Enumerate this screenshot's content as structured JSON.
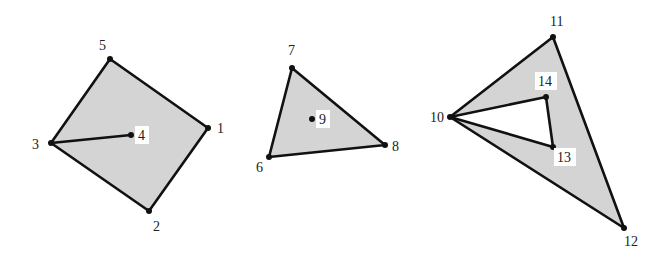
{
  "colors": {
    "fill": "#d4d4d4",
    "hole": "#ffffff",
    "edge": "#111111",
    "label": "#222222",
    "background": "#ffffff"
  },
  "vertices": [
    {
      "id": 1,
      "label": "1",
      "x": 208,
      "y": 128,
      "lx": 217,
      "ly": 133,
      "boxed": false
    },
    {
      "id": 2,
      "label": "2",
      "x": 149,
      "y": 211,
      "lx": 153,
      "ly": 231,
      "boxed": false
    },
    {
      "id": 3,
      "label": "3",
      "x": 51,
      "y": 143,
      "lx": 32,
      "ly": 149,
      "boxed": false
    },
    {
      "id": 4,
      "label": "4",
      "x": 131,
      "y": 135,
      "lx": 138,
      "ly": 140,
      "boxed": true
    },
    {
      "id": 5,
      "label": "5",
      "x": 110,
      "y": 59,
      "lx": 99,
      "ly": 50,
      "boxed": false
    },
    {
      "id": 6,
      "label": "6",
      "x": 269,
      "y": 157,
      "lx": 256,
      "ly": 172,
      "boxed": false
    },
    {
      "id": 7,
      "label": "7",
      "x": 292,
      "y": 68,
      "lx": 288,
      "ly": 55,
      "boxed": false
    },
    {
      "id": 8,
      "label": "8",
      "x": 385,
      "y": 145,
      "lx": 392,
      "ly": 151,
      "boxed": false
    },
    {
      "id": 9,
      "label": "9",
      "x": 312,
      "y": 119,
      "lx": 319,
      "ly": 124,
      "boxed": true
    },
    {
      "id": 10,
      "label": "10",
      "x": 450,
      "y": 117,
      "lx": 430,
      "ly": 122,
      "boxed": false
    },
    {
      "id": 11,
      "label": "11",
      "x": 553,
      "y": 37,
      "lx": 550,
      "ly": 26,
      "boxed": false
    },
    {
      "id": 12,
      "label": "12",
      "x": 624,
      "y": 228,
      "lx": 624,
      "ly": 246,
      "boxed": false
    },
    {
      "id": 13,
      "label": "13",
      "x": 553,
      "y": 147,
      "lx": 557,
      "ly": 162,
      "boxed": true
    },
    {
      "id": 14,
      "label": "14",
      "x": 546,
      "y": 97,
      "lx": 538,
      "ly": 86,
      "boxed": true
    }
  ],
  "regions": [
    {
      "name": "quadrilateral",
      "outer": [
        1,
        2,
        3,
        5
      ],
      "holes": [],
      "dangling_edges": [
        [
          3,
          4
        ]
      ],
      "isolated_points": []
    },
    {
      "name": "triangle",
      "outer": [
        6,
        7,
        8
      ],
      "holes": [],
      "dangling_edges": [],
      "isolated_points": [
        9
      ]
    },
    {
      "name": "triangle-with-hole",
      "outer": [
        10,
        11,
        12
      ],
      "holes": [
        [
          10,
          14,
          13
        ]
      ],
      "dangling_edges": [],
      "isolated_points": []
    }
  ]
}
